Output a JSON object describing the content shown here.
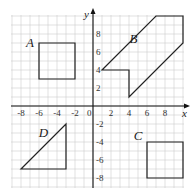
{
  "diagram": {
    "type": "coordinate-grid",
    "x_axis": {
      "label": "x",
      "min": -8,
      "max": 10,
      "ticks": [
        -8,
        -6,
        -4,
        -2,
        2,
        4,
        6,
        8
      ]
    },
    "y_axis": {
      "label": "y",
      "min": -8,
      "max": 10,
      "ticks": [
        8,
        6,
        4,
        2,
        -2,
        -4,
        -6,
        -8
      ]
    },
    "origin_label": "0",
    "grid": {
      "x_range": [
        -9,
        10
      ],
      "y_range": [
        -9,
        10
      ],
      "unit": 1
    },
    "shapes": [
      {
        "name": "A",
        "kind": "square",
        "vertices": [
          [
            -6,
            7
          ],
          [
            -2,
            7
          ],
          [
            -2,
            3
          ],
          [
            -6,
            3
          ]
        ],
        "label_pos": [
          -7,
          7
        ]
      },
      {
        "name": "B",
        "kind": "hexagon",
        "vertices": [
          [
            7,
            10
          ],
          [
            10,
            10
          ],
          [
            10,
            7
          ],
          [
            4,
            1
          ],
          [
            4,
            4
          ],
          [
            1,
            4
          ]
        ],
        "label_pos": [
          4.5,
          7.5
        ]
      },
      {
        "name": "C",
        "kind": "square",
        "vertices": [
          [
            6,
            -4
          ],
          [
            10,
            -4
          ],
          [
            10,
            -8
          ],
          [
            6,
            -8
          ]
        ],
        "label_pos": [
          5,
          -3.3
        ]
      },
      {
        "name": "D",
        "kind": "triangle",
        "vertices": [
          [
            -3,
            -2
          ],
          [
            -3,
            -7
          ],
          [
            -8,
            -7
          ]
        ],
        "label_pos": [
          -5.5,
          -3
        ]
      }
    ]
  },
  "colors": {
    "grid": "#cfcfcf",
    "axis": "#111111",
    "shape": "#222222"
  }
}
